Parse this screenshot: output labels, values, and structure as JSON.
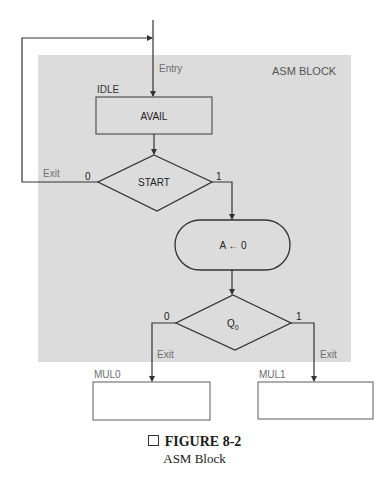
{
  "diagram": {
    "type": "asm-chart",
    "block_label": "ASM BLOCK",
    "entry_label": "Entry",
    "colors": {
      "block_background": "#dcdcdc",
      "line": "#333333",
      "label_gray": "#6e6e6e",
      "text": "#222222"
    },
    "state_box": {
      "name": "IDLE",
      "output": "AVAIL"
    },
    "decision_start": {
      "condition": "START",
      "false_label": "0",
      "true_label": "1",
      "false_exit_label": "Exit"
    },
    "conditional_output": {
      "text": "A ← 0"
    },
    "decision_q0": {
      "condition_base": "Q",
      "condition_sub": "0",
      "false_label": "0",
      "true_label": "1",
      "false_exit_label": "Exit",
      "true_exit_label": "Exit"
    },
    "next_states": [
      {
        "name": "MUL0"
      },
      {
        "name": "MUL1"
      }
    ]
  },
  "caption": {
    "title": "FIGURE 8-2",
    "subtitle": "ASM Block"
  }
}
